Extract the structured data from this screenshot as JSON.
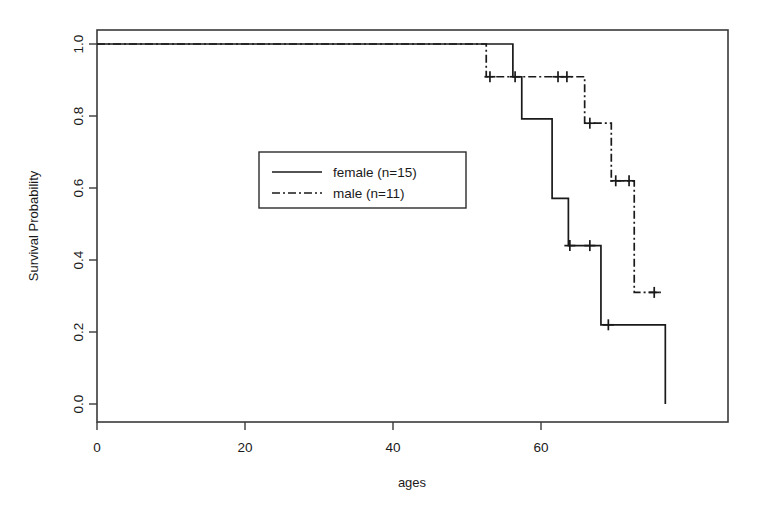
{
  "chart_data": {
    "type": "line",
    "title": "",
    "xlabel": "ages",
    "ylabel": "Survival Probability",
    "xlim": [
      0,
      79
    ],
    "ylim": [
      -0.03,
      1.05
    ],
    "xticks": [
      0,
      20,
      40,
      60
    ],
    "xtick_labels": [
      "0",
      "20",
      "40",
      "60"
    ],
    "yticks": [
      0.0,
      0.2,
      0.4,
      0.6,
      0.8,
      1.0
    ],
    "ytick_labels": [
      "0.0",
      "0.2",
      "0.4",
      "0.6",
      "0.8",
      "1.0"
    ],
    "grid": false,
    "legend_position": "center-left",
    "legend": [
      {
        "name": "female (n=15)",
        "linestyle": "solid",
        "color": "#1a1a1a"
      },
      {
        "name": "male (n=11)",
        "linestyle": "dashdot",
        "color": "#1a1a1a"
      }
    ],
    "series": [
      {
        "name": "female (n=15)",
        "linestyle": "solid",
        "color": "#1a1a1a",
        "steps": [
          {
            "x": 0.0,
            "y": 1.0
          },
          {
            "x": 56.2,
            "y": 0.909
          },
          {
            "x": 57.4,
            "y": 0.792
          },
          {
            "x": 61.5,
            "y": 0.571
          },
          {
            "x": 63.7,
            "y": 0.44
          },
          {
            "x": 68.1,
            "y": 0.22
          },
          {
            "x": 76.8,
            "y": 0.0
          }
        ],
        "censored": [
          {
            "x": 56.5,
            "y": 0.909
          },
          {
            "x": 63.9,
            "y": 0.44
          },
          {
            "x": 66.6,
            "y": 0.44
          },
          {
            "x": 69.1,
            "y": 0.22
          }
        ]
      },
      {
        "name": "male (n=11)",
        "linestyle": "dashdot",
        "color": "#1a1a1a",
        "steps": [
          {
            "x": 0.0,
            "y": 1.0
          },
          {
            "x": 52.6,
            "y": 0.909
          },
          {
            "x": 65.9,
            "y": 0.78
          },
          {
            "x": 69.5,
            "y": 0.62
          },
          {
            "x": 72.6,
            "y": 0.31
          }
        ],
        "censored": [
          {
            "x": 53.1,
            "y": 0.909
          },
          {
            "x": 62.3,
            "y": 0.909
          },
          {
            "x": 63.5,
            "y": 0.909
          },
          {
            "x": 66.6,
            "y": 0.78
          },
          {
            "x": 70.1,
            "y": 0.62
          },
          {
            "x": 71.9,
            "y": 0.62
          },
          {
            "x": 75.3,
            "y": 0.31
          }
        ]
      }
    ]
  },
  "figure": {
    "background": "#ffffff",
    "axis_color": "#3a3a3a",
    "line_color": "#1a1a1a"
  }
}
